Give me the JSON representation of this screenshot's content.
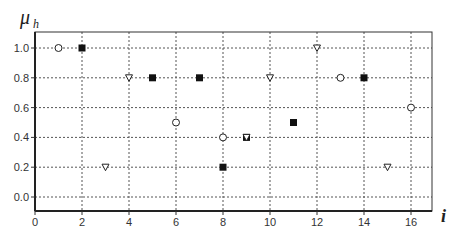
{
  "chart_data": {
    "type": "scatter",
    "title": "",
    "xlabel": "i",
    "ylabel": "μ",
    "ylabel_subscript": "h",
    "xlim": [
      0,
      17
    ],
    "ylim": [
      -0.1,
      1.1
    ],
    "x_ticks": [
      0,
      2,
      4,
      6,
      8,
      10,
      12,
      14,
      16
    ],
    "x_tick_labels": [
      "0",
      "2",
      "4",
      "6",
      "8",
      "10",
      "12",
      "14",
      "16"
    ],
    "y_ticks": [
      0.0,
      0.2,
      0.4,
      0.6,
      0.8,
      1.0
    ],
    "y_tick_labels": [
      "0.0",
      "0.2",
      "0.4",
      "0.6",
      "0.8",
      "1.0"
    ],
    "grid": true,
    "grid_style": "dotted",
    "legend": null,
    "series": [
      {
        "name": "open-circle",
        "marker": "circle-open",
        "points": [
          [
            1,
            1.0
          ],
          [
            6,
            0.5
          ],
          [
            8,
            0.4
          ],
          [
            13,
            0.8
          ],
          [
            16,
            0.6
          ]
        ]
      },
      {
        "name": "filled-square",
        "marker": "square-filled",
        "points": [
          [
            2,
            1.0
          ],
          [
            5,
            0.8
          ],
          [
            7,
            0.8
          ],
          [
            8,
            0.2
          ],
          [
            9,
            0.4
          ],
          [
            11,
            0.5
          ],
          [
            14,
            0.8
          ]
        ]
      },
      {
        "name": "open-triangle-down",
        "marker": "triangle-down-open",
        "points": [
          [
            3,
            0.2
          ],
          [
            4,
            0.8
          ],
          [
            9,
            0.4
          ],
          [
            10,
            0.8
          ],
          [
            12,
            1.0
          ],
          [
            15,
            0.2
          ]
        ]
      }
    ]
  },
  "colors": {
    "axis": "#333333",
    "grid": "#555555",
    "marker_fill": "#111111",
    "marker_open_fill": "#ffffff"
  }
}
